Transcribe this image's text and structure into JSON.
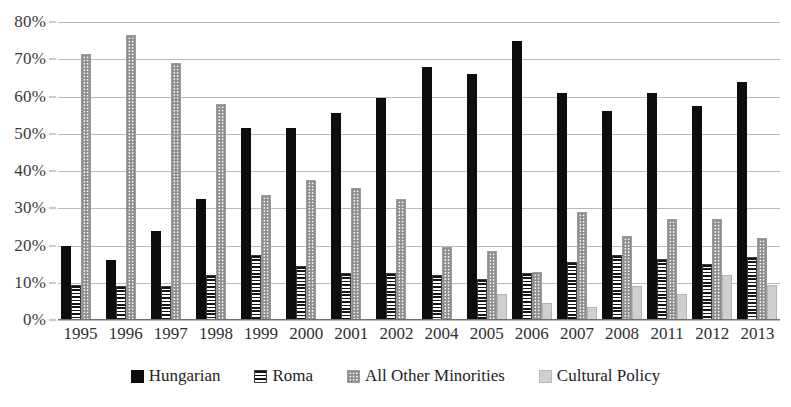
{
  "chart_data": {
    "type": "bar",
    "title": "",
    "xlabel": "",
    "ylabel": "",
    "ylim": [
      0,
      80
    ],
    "ytick_step": 10,
    "ytick_labels": [
      "0%",
      "10%",
      "20%",
      "30%",
      "40%",
      "50%",
      "60%",
      "70%",
      "80%"
    ],
    "grid": true,
    "legend_position": "bottom",
    "categories": [
      "1995",
      "1996",
      "1997",
      "1998",
      "1999",
      "2000",
      "2001",
      "2002",
      "2004",
      "2005",
      "2006",
      "2007",
      "2008",
      "2011",
      "2012",
      "2013"
    ],
    "series": [
      {
        "name": "Hungarian",
        "key": "hungarian",
        "color": "#0d0d0d",
        "pattern": "solid",
        "values": [
          20,
          16,
          24,
          32.5,
          51.5,
          51.5,
          55.5,
          59.5,
          68,
          66,
          75,
          61,
          56,
          61,
          57.5,
          64
        ]
      },
      {
        "name": "Roma",
        "key": "roma",
        "color": "#151515",
        "pattern": "horizontal-stripes",
        "values": [
          9.5,
          9,
          9,
          12,
          17.5,
          14.5,
          12.5,
          12.5,
          12,
          11,
          12.5,
          15.5,
          17.5,
          16.5,
          15,
          17
        ]
      },
      {
        "name": "All Other Minorities",
        "key": "aom",
        "color": "#8d8d8d",
        "pattern": "dotted-grid",
        "values": [
          71.5,
          76.5,
          69,
          58,
          33.5,
          37.5,
          35.5,
          32.5,
          19.5,
          18.5,
          13,
          29,
          22.5,
          27,
          27,
          22
        ]
      },
      {
        "name": "Cultural Policy",
        "key": "cultural",
        "color": "#cfcfcf",
        "pattern": "solid-light",
        "values": [
          null,
          null,
          null,
          null,
          null,
          null,
          null,
          null,
          null,
          7,
          4.5,
          3.5,
          9,
          7,
          12,
          9.5
        ]
      }
    ]
  },
  "legend": {
    "items": [
      {
        "label": "Hungarian",
        "key": "hungarian"
      },
      {
        "label": "Roma",
        "key": "roma"
      },
      {
        "label": "All Other Minorities",
        "key": "aom"
      },
      {
        "label": "Cultural Policy",
        "key": "cultural"
      }
    ]
  }
}
